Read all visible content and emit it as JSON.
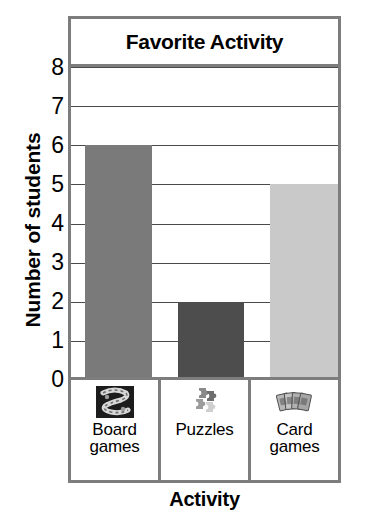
{
  "chart_data": {
    "type": "bar",
    "title": "Favorite Activity",
    "xlabel": "Activity",
    "ylabel": "Number of students",
    "categories": [
      "Board games",
      "Puzzles",
      "Card games"
    ],
    "values": [
      6,
      2,
      5
    ],
    "ylim": [
      0,
      8
    ],
    "yticks": [
      "0",
      "1",
      "2",
      "3",
      "4",
      "5",
      "6",
      "7",
      "8"
    ],
    "grid": true,
    "legend": "none",
    "series": [
      {
        "name": "Number of students",
        "values": [
          6,
          2,
          5
        ]
      }
    ],
    "bar_colors": [
      "#7a7a7a",
      "#4d4d4d",
      "#c9c9c9"
    ]
  },
  "chart": {
    "title": "Favorite Activity",
    "y_axis_title": "Number of students",
    "x_axis_title": "Activity",
    "y_ticks": [
      "8",
      "7",
      "6",
      "5",
      "4",
      "3",
      "2",
      "1",
      "0"
    ],
    "frame_color": "#7d7d7d",
    "gridline_color": "#4a4a4a"
  },
  "categories": [
    {
      "label_line1": "Board",
      "label_line2": "games",
      "icon": "board-game-icon",
      "value": 6,
      "bar_color": "#7a7a7a"
    },
    {
      "label_line1": "Puzzles",
      "label_line2": "",
      "icon": "puzzle-pieces-icon",
      "value": 2,
      "bar_color": "#4d4d4d"
    },
    {
      "label_line1": "Card",
      "label_line2": "games",
      "icon": "playing-cards-icon",
      "value": 5,
      "bar_color": "#c9c9c9"
    }
  ]
}
